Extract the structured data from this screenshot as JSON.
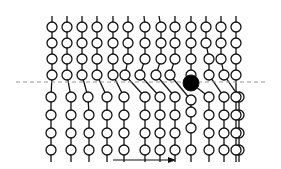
{
  "diagram": {
    "colors": {
      "background": "#ffffff",
      "stroke": "#111111",
      "bead_fill": "#ffffff",
      "highlight_fill": "#000000",
      "dashed_line": "#999999"
    },
    "dashed_line": {
      "x1": 16,
      "x2": 268,
      "y": 82
    },
    "arrow": {
      "x1": 113,
      "x2": 176,
      "y": 160,
      "direction": "right"
    },
    "bead_radius": 5,
    "highlight": {
      "column": 9,
      "x": 191,
      "y": 83,
      "r": 8
    },
    "chains": [
      {
        "top_x": 52,
        "upper": [
          52,
          52,
          52,
          52
        ],
        "lower": [
          51,
          51,
          51,
          51
        ],
        "lower_y": [
          97,
          115,
          133,
          150
        ]
      },
      {
        "top_x": 67,
        "upper": [
          67,
          67,
          67,
          67
        ],
        "lower": [
          71,
          71,
          71,
          71
        ],
        "lower_y": [
          97,
          115,
          133,
          150
        ]
      },
      {
        "top_x": 82,
        "upper": [
          82,
          82,
          82,
          82
        ],
        "lower": [
          88,
          89,
          89,
          89
        ],
        "lower_y": [
          97,
          115,
          133,
          150
        ]
      },
      {
        "top_x": 97,
        "upper": [
          97,
          97,
          97,
          97
        ],
        "lower": [
          107,
          107,
          107,
          107
        ],
        "lower_y": [
          97,
          115,
          133,
          150
        ]
      },
      {
        "top_x": 113,
        "upper": [
          113,
          113,
          113,
          113
        ],
        "lower": [
          124,
          124,
          124,
          124
        ],
        "lower_y": [
          97,
          115,
          133,
          150
        ]
      },
      {
        "top_x": 128,
        "upper": [
          128,
          128,
          128,
          125
        ],
        "lower": [
          145,
          145,
          145,
          145
        ],
        "lower_y": [
          97,
          115,
          133,
          150
        ]
      },
      {
        "top_x": 144,
        "upper": [
          145,
          145,
          145,
          140
        ],
        "lower": [
          160,
          160,
          160,
          160
        ],
        "lower_y": [
          97,
          115,
          133,
          150
        ]
      },
      {
        "top_x": 159,
        "upper": [
          161,
          161,
          161,
          156
        ],
        "lower": [
          175,
          175,
          175,
          175
        ],
        "lower_y": [
          97,
          115,
          133,
          150
        ]
      },
      {
        "top_x": 175,
        "upper": [
          175,
          175,
          175,
          170
        ],
        "lower": [
          191,
          191,
          191,
          191
        ],
        "lower_y": [
          100,
          112,
          128,
          150
        ]
      },
      {
        "top_x": 191,
        "upper": [
          191,
          191,
          191,
          191
        ],
        "lower": [
          209,
          209,
          209,
          209
        ],
        "lower_y": [
          97,
          115,
          133,
          150
        ]
      },
      {
        "top_x": 206,
        "upper": [
          206,
          206,
          209,
          209
        ],
        "lower": [
          224,
          224,
          224,
          224
        ],
        "lower_y": [
          97,
          115,
          133,
          150
        ]
      },
      {
        "top_x": 221,
        "upper": [
          221,
          221,
          221,
          224
        ],
        "lower": [
          239,
          239,
          239,
          239
        ],
        "lower_y": [
          97,
          115,
          133,
          150
        ]
      },
      {
        "top_x": 236,
        "upper": [
          236,
          236,
          236,
          236
        ],
        "lower": [
          236,
          236,
          236,
          236
        ],
        "lower_y": [
          97,
          115,
          133,
          150
        ]
      }
    ],
    "upper_y": [
      27,
      43,
      59,
      75
    ]
  }
}
